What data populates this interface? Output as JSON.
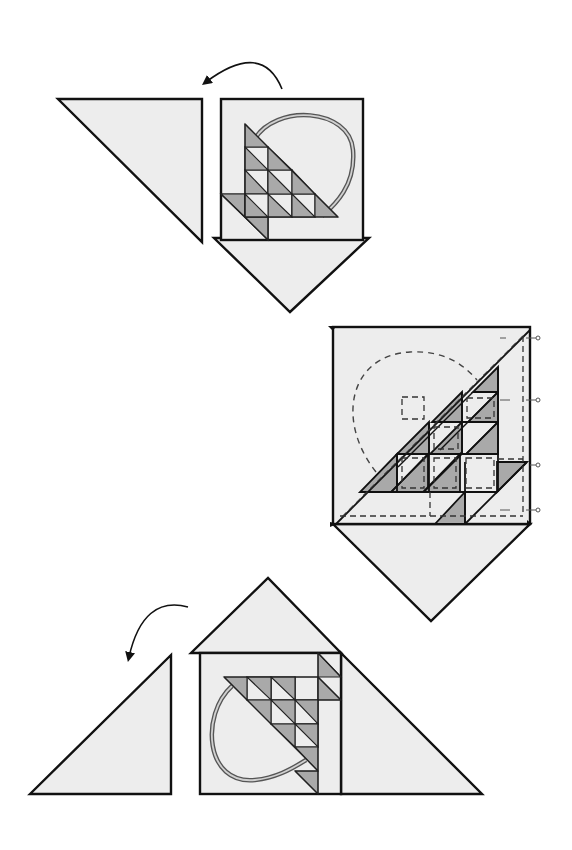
{
  "colors": {
    "background": "#ffffff",
    "fabric_light": "#ededed",
    "fabric_dark": "#a9a9a9",
    "stroke": "#111111",
    "handle_outer": "#555555",
    "handle_inner": "#cfcfcf"
  },
  "steps": [
    {
      "name": "step-1-top",
      "rotation_arrow": {
        "path": "M282 89 Q262 40 204 84",
        "head": [
          200,
          90
        ],
        "direction": "counter-clockwise"
      },
      "pieces": [
        {
          "name": "left-setting-triangle",
          "points": "58,99 202,99 202,242",
          "fill": "light"
        },
        {
          "name": "center-block",
          "points": "221,99 363,99 363,240 221,240",
          "fill": "light"
        },
        {
          "name": "bottom-setting-triangle",
          "points": "214,238 369,238 290,312",
          "fill": "light"
        }
      ],
      "basket": {
        "origin": [
          245,
          124
        ],
        "cell": 23.3,
        "orientation": "up-right",
        "handle": "M253 142 C 270 110, 350 110, 352 150 C 355 185, 330 205, 322 215"
      }
    },
    {
      "name": "step-2-middle",
      "pieces": [
        {
          "name": "center-block-on-point",
          "points": "333,327 530,327 530,524 333,524",
          "fill": "light"
        },
        {
          "name": "bottom-setting-triangle",
          "points": "333,524 530,524 431,621",
          "fill": "light"
        }
      ],
      "seam_marks": [
        [
          538,
          338
        ],
        [
          538,
          400
        ],
        [
          538,
          465
        ],
        [
          538,
          510
        ]
      ],
      "annotation": "dashed seam allowance lines"
    },
    {
      "name": "step-3-bottom",
      "rotation_arrow": {
        "path": "M188 607 Q145 590 130 655",
        "head": [
          128,
          666
        ],
        "direction": "counter-clockwise"
      },
      "pieces": [
        {
          "name": "left-setting-triangle",
          "points": "30,794 171,655 171,794",
          "fill": "light"
        },
        {
          "name": "top-setting-triangle",
          "points": "191,653 341,653 268,578",
          "fill": "light"
        },
        {
          "name": "center-block",
          "points": "200,653 341,653 341,794 200,794",
          "fill": "light"
        },
        {
          "name": "right-setting-triangle",
          "points": "341,653 482,794 341,794",
          "fill": "light"
        }
      ],
      "basket": {
        "origin": [
          318,
          677
        ],
        "cell": 23.5,
        "orientation": "down-left"
      }
    }
  ]
}
